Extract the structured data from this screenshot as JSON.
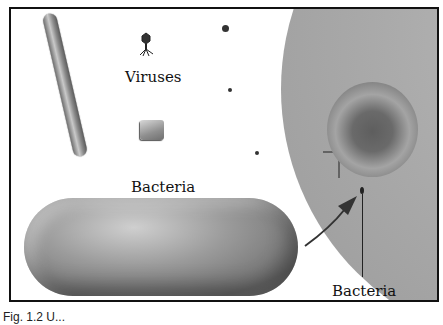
{
  "figure": {
    "labels": {
      "viruses": "Viruses",
      "bacteria_main": "Bacteria",
      "bacteria_small": "Bacteria"
    },
    "caption": "Fig. 1.2  U...",
    "elements": [
      {
        "name": "rod-shaped-virus",
        "type": "virus"
      },
      {
        "name": "bacteriophage",
        "type": "virus"
      },
      {
        "name": "cubic-virus",
        "type": "virus"
      },
      {
        "name": "spherical-virus-particles",
        "count": 3,
        "type": "virus"
      },
      {
        "name": "large-bacterium",
        "type": "bacteria"
      },
      {
        "name": "red-blood-cell",
        "type": "cell"
      },
      {
        "name": "small-bacterium",
        "type": "bacteria"
      }
    ],
    "colors": {
      "frame": "#111111",
      "background": "#ffffff",
      "plasma": "#a9a9a9"
    }
  }
}
